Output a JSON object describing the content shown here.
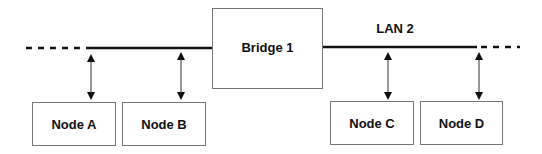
{
  "diagram": {
    "bridge": {
      "label": "Bridge 1"
    },
    "lan_label": "LAN 2",
    "nodes": [
      {
        "label": "Node A"
      },
      {
        "label": "Node B"
      },
      {
        "label": "Node C"
      },
      {
        "label": "Node D"
      }
    ]
  }
}
